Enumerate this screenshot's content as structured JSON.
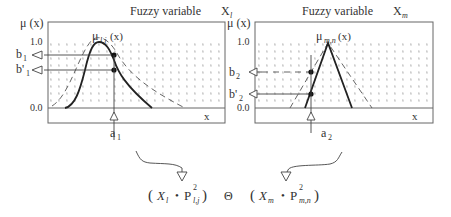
{
  "panels": [
    {
      "title": "Fuzzy variable",
      "var_symbol": "X",
      "var_sub": "l",
      "y_axis_label": "μ (x)",
      "tick_top": "1.0",
      "tick_bottom": "0.0",
      "x_axis_label": "x",
      "curve_label": "μ",
      "curve_sub": "l,j",
      "curve_arg": "(x)",
      "b_label": "b",
      "b_sub": "1",
      "bprime_label": "b'",
      "bprime_sub": "1",
      "a_label": "a",
      "a_sub": "1"
    },
    {
      "title": "Fuzzy variable",
      "var_symbol": "X",
      "var_sub": "m",
      "y_axis_label": "μ (x)",
      "tick_top": "1.0",
      "tick_bottom": "0.0",
      "x_axis_label": "x",
      "curve_label": "μ",
      "curve_sub": "m,n",
      "curve_arg": "(x)",
      "b_label": "b",
      "b_sub": "2",
      "bprime_label": "b'",
      "bprime_sub": "2",
      "a_label": "a",
      "a_sub": "2"
    }
  ],
  "formula": {
    "left_open": "(",
    "left_var": "X",
    "left_var_sub": "l",
    "left_dot": "•",
    "left_p": "P",
    "left_p_sup": "2",
    "left_p_sub": "l,j",
    "left_close": ")",
    "operator": "Θ",
    "right_open": "(",
    "right_var": "X",
    "right_var_sub": "m",
    "right_dot": "•",
    "right_p": "P",
    "right_p_sup": "2",
    "right_p_sub": "m,n",
    "right_close": ")"
  },
  "colors": {
    "line": "#333333",
    "grid": "#999999",
    "box": "#666666"
  }
}
